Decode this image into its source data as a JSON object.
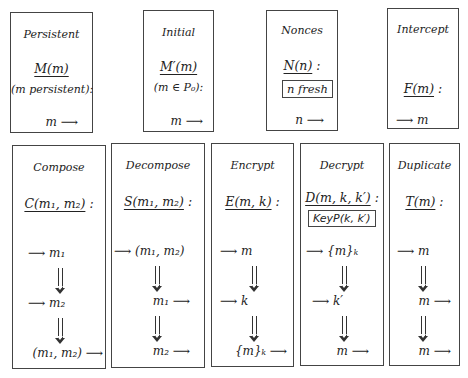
{
  "rules": {
    "persistent": {
      "title": "Persistent",
      "name": "M(m)",
      "condition": "(m persistent):",
      "out": "m ⟶"
    },
    "initial": {
      "title": "Initial",
      "name": "M′(m)",
      "condition": "(m ∈ P₀):",
      "out": "m ⟶"
    },
    "nonces": {
      "title": "Nonces",
      "name": "N(n)",
      "colon": ":",
      "predicate": "n fresh",
      "out": "n ⟶"
    },
    "intercept": {
      "title": "Intercept",
      "name": "F(m)",
      "colon": ":",
      "in": "⟶ m"
    },
    "compose": {
      "title": "Compose",
      "name": "C(m₁, m₂)",
      "colon": ":",
      "steps": [
        "⟶ m₁",
        "⟶ m₂",
        "(m₁, m₂) ⟶"
      ]
    },
    "decompose": {
      "title": "Decompose",
      "name": "S(m₁, m₂)",
      "colon": ":",
      "steps": [
        "⟶ (m₁, m₂)",
        "m₁ ⟶",
        "m₂ ⟶"
      ]
    },
    "encrypt": {
      "title": "Encrypt",
      "name": "E(m, k)",
      "colon": ":",
      "steps": [
        "⟶ m",
        "⟶ k",
        "{m}ₖ ⟶"
      ]
    },
    "decrypt": {
      "title": "Decrypt",
      "name": "D(m, k, k′)",
      "colon": ":",
      "predicate": "KeyP(k, k′)",
      "steps": [
        "⟶ {m}ₖ",
        "⟶ k′",
        "m ⟶"
      ]
    },
    "duplicate": {
      "title": "Duplicate",
      "name": "T(m)",
      "colon": ":",
      "steps": [
        "⟶ m",
        "m ⟶",
        "m ⟶"
      ]
    }
  }
}
